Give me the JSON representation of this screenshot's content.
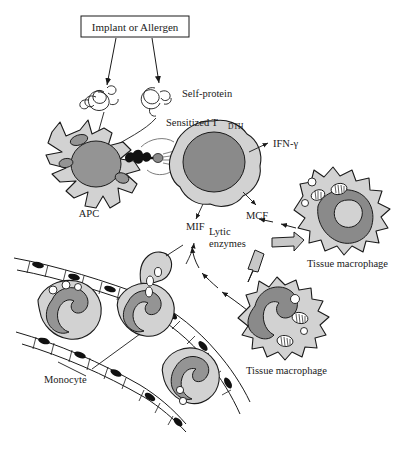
{
  "figure": {
    "title_box": "Implant or Allergen",
    "labels": {
      "self_protein": "Self-protein",
      "sensitized_t": "Sensitized T",
      "sensitized_t_sub": "DTH",
      "ifn_gamma": "IFN-γ",
      "mcf": "MCF",
      "mif": "MIF",
      "lytic_line1": "Lytic",
      "lytic_line2": "enzymes",
      "apc": "APC",
      "tissue_macrophage_right": "Tissue macrophage",
      "tissue_macrophage_bottom": "Tissue macrophage",
      "monocyte": "Monocyte"
    },
    "colors": {
      "outline": "#1a1a1a",
      "cytoplasm": "#d2d2d2",
      "nucleus": "#949494",
      "nucleus_dark": "#8a8a8a",
      "arrow_block": "#c8c8c8",
      "endothelial_nucleus": "#111111",
      "background": "#ffffff"
    },
    "cells": [
      {
        "name": "apc",
        "label": "APC",
        "nucleus": "large-round",
        "shape": "dendritic-star"
      },
      {
        "name": "sensitized-t-cell",
        "label": "Sensitized TDTH",
        "nucleus": "large-round",
        "shape": "ruffled-round"
      },
      {
        "name": "tissue-macrophage-right",
        "label": "Tissue macrophage",
        "nucleus": "kidney",
        "shape": "ruffled-amoeboid"
      },
      {
        "name": "tissue-macrophage-bottom",
        "label": "Tissue macrophage",
        "nucleus": "kidney",
        "shape": "ruffled-amoeboid"
      },
      {
        "name": "monocyte-upper-left",
        "label": "Monocyte",
        "nucleus": "kidney",
        "shape": "round"
      },
      {
        "name": "monocyte-center",
        "label": "Monocyte",
        "nucleus": "kidney",
        "shape": "round"
      },
      {
        "name": "monocyte-lower-right",
        "label": "Monocyte",
        "nucleus": "kidney",
        "shape": "round"
      }
    ],
    "cytokines": [
      "IFN-γ",
      "MCF",
      "MIF",
      "Lytic enzymes"
    ]
  }
}
